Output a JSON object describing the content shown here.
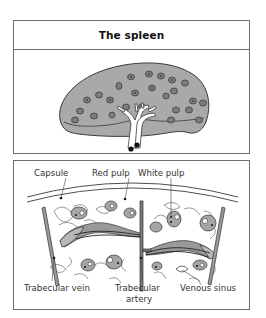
{
  "figure": {
    "top_panel": {
      "title": "The spleen",
      "illustration": "spleen-organ-gross-anatomy"
    },
    "bottom_panel": {
      "illustration": "spleen-microscopic-section",
      "labels": {
        "capsule": "Capsule",
        "red_pulp": "Red pulp",
        "white_pulp": "White pulp",
        "trabecular_vein": "Trabecular vein",
        "trabecular_artery_line1": "Trabecular",
        "trabecular_artery_line2": "artery",
        "venous_sinus": "Venous sinus"
      }
    },
    "colors": {
      "organ_fill": "#a9a9a9",
      "follicle_fill": "#8c8c8c",
      "outline": "#3a3a3a",
      "vessel_fill": "#ffffff",
      "border": "#6e6e6e"
    }
  }
}
